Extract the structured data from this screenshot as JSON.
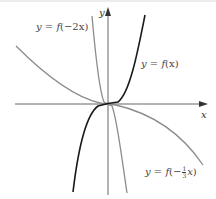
{
  "figure": {
    "type": "function-transformation-graph",
    "axes": {
      "x_label": "x",
      "y_label": "y"
    },
    "curves": [
      {
        "id": "f",
        "label": "y = f(x)",
        "color": "#1a1a1a",
        "description": "odd cubic-like curve through origin, increasing"
      },
      {
        "id": "f_neg2x",
        "label": "y = f(−2x)",
        "color": "#8a8a8a",
        "description": "horizontal compression by 1/2 and reflection in y-axis"
      },
      {
        "id": "f_neg_third_x",
        "label": "y = f(−⅓x)",
        "color": "#8a8a8a",
        "description": "horizontal stretch by 3 and reflection in y-axis"
      }
    ],
    "labels": {
      "f": {
        "prefix": "y = ",
        "func": "f",
        "arg": "(x)"
      },
      "f_neg2x": {
        "prefix": "y = ",
        "func": "f",
        "arg": "(−2x)"
      },
      "f_neg_third_x": {
        "prefix": "y = ",
        "func": "f",
        "open": "(−",
        "num": "1",
        "den": "3",
        "var": "x",
        "close": ")"
      }
    },
    "colors": {
      "axis": "#555555",
      "f": "#1a1a1a",
      "transformed": "#8c8c8c",
      "text": "#444444"
    }
  }
}
